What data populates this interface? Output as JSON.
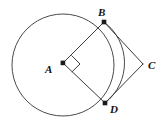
{
  "figure": {
    "type": "geometry-diagram",
    "background_color": "#ffffff",
    "stroke_color": "#3b3b3b",
    "circle_stroke_color": "#4a4a4a",
    "vertex_color": "#1a1a1a",
    "label_color": "#111111"
  },
  "circle": {
    "name": "circle-A",
    "center_x": 63,
    "center_y": 65,
    "radius": 51
  },
  "points": [
    {
      "id": "A",
      "label": "A",
      "x": 63,
      "y": 63,
      "label_x": 45,
      "label_y": 64,
      "role": "center",
      "dot": true
    },
    {
      "id": "B",
      "label": "B",
      "x": 104,
      "y": 22,
      "label_x": 98,
      "label_y": 7,
      "role": "on-circle",
      "dot": true
    },
    {
      "id": "C",
      "label": "C",
      "x": 143,
      "y": 64,
      "label_x": 148,
      "label_y": 60,
      "role": "external-vertex",
      "dot": false
    },
    {
      "id": "D",
      "label": "D",
      "x": 105,
      "y": 103,
      "label_x": 110,
      "label_y": 104,
      "role": "on-circle",
      "dot": true
    }
  ],
  "segments": [
    {
      "name": "segment-AB",
      "from": "A",
      "to": "B",
      "x1": 63,
      "y1": 63,
      "x2": 104,
      "y2": 22
    },
    {
      "name": "segment-AD",
      "from": "A",
      "to": "D",
      "x1": 63,
      "y1": 63,
      "x2": 105,
      "y2": 103
    },
    {
      "name": "segment-BC",
      "from": "B",
      "to": "C",
      "x1": 104,
      "y1": 22,
      "x2": 143,
      "y2": 64
    },
    {
      "name": "segment-DC",
      "from": "D",
      "to": "C",
      "x1": 105,
      "y1": 103,
      "x2": 143,
      "y2": 64
    }
  ],
  "angle_marks": [
    {
      "name": "right-angle-at-A",
      "vertex": "A",
      "measure_degrees": 90,
      "path": "M 71.5 55.4 L 80.0 64.0 L 71.8 72.0"
    }
  ],
  "arc": {
    "name": "arc-BD-minor",
    "description": "minor arc of circle A from B to D passing right of chord BD",
    "path": "M 104 22 A 51 51 0 0 1 105 103"
  },
  "circle_path": {
    "name": "circle-outline",
    "path": "M 63 14 A 51 51 0 1 1 62.999 14"
  }
}
